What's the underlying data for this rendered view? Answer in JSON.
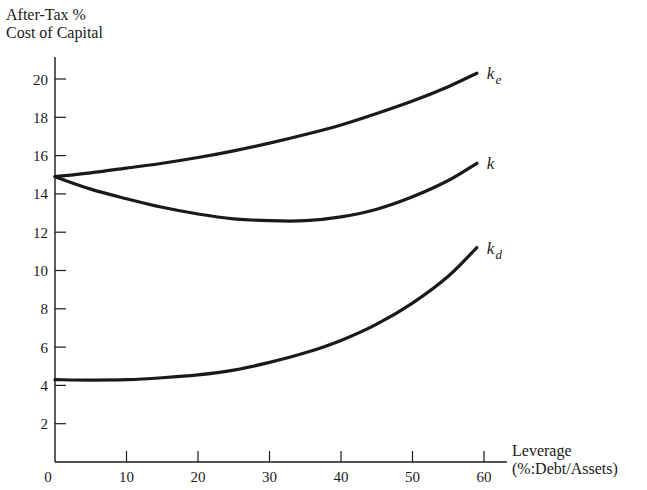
{
  "chart_data": {
    "type": "line",
    "title": "",
    "ylabel_line1": "After-Tax %",
    "ylabel_line2": "Cost of Capital",
    "xlabel_line1": "Leverage",
    "xlabel_line2": "(%:Debt/Assets)",
    "xlim": [
      0,
      60
    ],
    "ylim": [
      0,
      20
    ],
    "x_ticks": [
      0,
      10,
      20,
      30,
      40,
      50,
      60
    ],
    "y_ticks": [
      2,
      4,
      6,
      8,
      10,
      12,
      14,
      16,
      18,
      20
    ],
    "grid": false,
    "legend": "inline labels at curve ends",
    "x": [
      0,
      5,
      10,
      15,
      20,
      25,
      30,
      35,
      40,
      45,
      50,
      55,
      59
    ],
    "series": [
      {
        "name": "k_e",
        "label_main": "k",
        "label_sub": "e",
        "values": [
          14.9,
          15.1,
          15.35,
          15.6,
          15.9,
          16.25,
          16.65,
          17.1,
          17.6,
          18.2,
          18.85,
          19.6,
          20.3
        ]
      },
      {
        "name": "k",
        "label_main": "k",
        "label_sub": "",
        "values": [
          14.9,
          14.25,
          13.75,
          13.3,
          12.95,
          12.7,
          12.6,
          12.6,
          12.8,
          13.2,
          13.85,
          14.7,
          15.6
        ]
      },
      {
        "name": "k_d",
        "label_main": "k",
        "label_sub": "d",
        "values": [
          4.3,
          4.28,
          4.3,
          4.4,
          4.55,
          4.8,
          5.2,
          5.7,
          6.35,
          7.2,
          8.3,
          9.7,
          11.2
        ]
      }
    ]
  },
  "colors": {
    "ink": "#1a1a1a",
    "background": "#ffffff"
  }
}
